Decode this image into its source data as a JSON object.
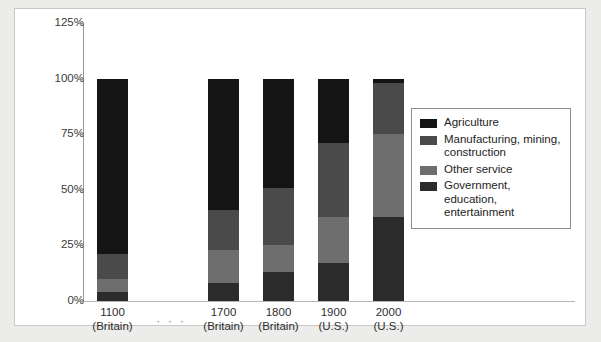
{
  "chart_data": {
    "type": "bar",
    "subtype": "stacked-100-percent",
    "title": "",
    "xlabel": "",
    "ylabel": "",
    "ylim": [
      0,
      125
    ],
    "ytick_labels": [
      "0%",
      "25%",
      "50%",
      "75%",
      "100%",
      "125%"
    ],
    "ytick_values": [
      0,
      25,
      50,
      75,
      100,
      125
    ],
    "grid": false,
    "legend_position": "right",
    "categories": [
      "1100",
      "1700",
      "1800",
      "1900",
      "2000"
    ],
    "category_sublabels": [
      "(Britain)",
      "(Britain)",
      "(Britain)",
      "(U.S.)",
      "(U.S.)"
    ],
    "axis_break_marker": "· · ·",
    "series": [
      {
        "name": "Agriculture",
        "color": "#141414",
        "values": [
          79,
          59,
          49,
          29,
          2
        ]
      },
      {
        "name": "Manufacturing, mining, construction",
        "color": "#4a4a4a",
        "values": [
          11,
          18,
          26,
          33,
          23
        ]
      },
      {
        "name": "Other service",
        "color": "#6e6e6e",
        "values": [
          6,
          15,
          12,
          21,
          37
        ]
      },
      {
        "name": "Government, education, entertainment",
        "color": "#2b2b2b",
        "values": [
          4,
          8,
          13,
          17,
          38
        ]
      }
    ],
    "stack_tops": [
      100,
      100,
      100,
      100,
      100
    ]
  },
  "axis": {
    "ticks": [
      {
        "label": "125%",
        "value": 125
      },
      {
        "label": "100%",
        "value": 100
      },
      {
        "label": "75%",
        "value": 75
      },
      {
        "label": "50%",
        "value": 50
      },
      {
        "label": "25%",
        "value": 25
      },
      {
        "label": "0%",
        "value": 0
      }
    ]
  },
  "legend": {
    "items": [
      {
        "label": "Agriculture",
        "color": "#141414"
      },
      {
        "label": "Manufacturing, mining, construction",
        "color": "#4a4a4a"
      },
      {
        "label": "Other service",
        "color": "#6e6e6e"
      },
      {
        "label": "Government, education, entertainment",
        "color": "#2b2b2b"
      }
    ]
  },
  "x_axis": {
    "items": [
      {
        "year": "1100",
        "region": "(Britain)"
      },
      {
        "year": "1700",
        "region": "(Britain)"
      },
      {
        "year": "1800",
        "region": "(Britain)"
      },
      {
        "year": "1900",
        "region": "(U.S.)"
      },
      {
        "year": "2000",
        "region": "(U.S.)"
      }
    ],
    "break_marker": "· · ·"
  },
  "colors": {
    "page_background": "#ececeb",
    "card_background": "#ffffff",
    "card_border": "#c8c8c6",
    "axis": "#9a9a98",
    "text": "#2e2e2e"
  }
}
